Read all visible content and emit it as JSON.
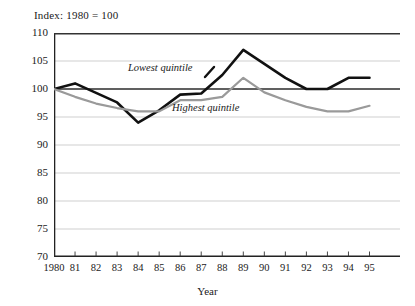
{
  "chart_data": {
    "type": "line",
    "title": "Index: 1980 = 100",
    "xlabel": "Year",
    "ylabel": "",
    "xlim": [
      1980,
      1995
    ],
    "ylim": [
      70,
      110
    ],
    "ytick_step": 5,
    "grid": true,
    "legend_position": "inline-annotations",
    "x": [
      1980,
      1981,
      1982,
      1983,
      1984,
      1985,
      1986,
      1987,
      1988,
      1989,
      1990,
      1991,
      1992,
      1993,
      1994,
      1995
    ],
    "categories": [
      "1980",
      "81",
      "82",
      "83",
      "84",
      "85",
      "86",
      "87",
      "88",
      "89",
      "90",
      "91",
      "92",
      "93",
      "94",
      "95"
    ],
    "yticks": [
      "110",
      "105",
      "100",
      "95",
      "90",
      "85",
      "80",
      "75",
      "70"
    ],
    "series": [
      {
        "name": "Lowest quintile",
        "color": "#111111",
        "values": [
          100,
          101,
          99.3,
          97.6,
          94,
          96.2,
          99,
          99.2,
          102.5,
          107,
          104.5,
          102,
          100,
          100,
          102,
          102
        ]
      },
      {
        "name": "Highest quintile",
        "color": "#9a9a9a",
        "values": [
          100,
          98.6,
          97.4,
          96.6,
          96,
          96,
          98,
          98,
          98.6,
          102,
          99.4,
          98,
          96.8,
          96,
          96,
          97
        ]
      }
    ],
    "annotations": [
      {
        "text": "Lowest quintile",
        "series": "Lowest quintile"
      },
      {
        "text": "Highest quintile",
        "series": "Highest quintile"
      }
    ]
  }
}
